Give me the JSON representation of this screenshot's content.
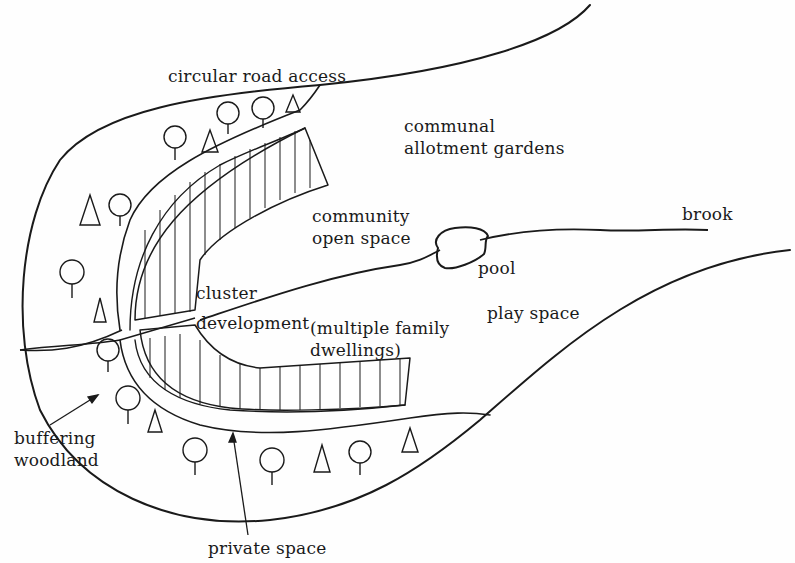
{
  "diagram": {
    "type": "site-plan-sketch",
    "labels": {
      "circular_road_access": "circular road access",
      "communal_allotment_1": "communal",
      "communal_allotment_2": "allotment gardens",
      "community_open_1": "community",
      "community_open_2": "open space",
      "brook": "brook",
      "pool": "pool",
      "cluster": "cluster",
      "development": "development",
      "multiple_family_1": "(multiple family",
      "multiple_family_2": "dwellings)",
      "play_space": "play space",
      "buffering_1": "buffering",
      "buffering_2": "woodland",
      "private_space": "private space"
    },
    "colors": {
      "ink": "#1a1a1a",
      "paper": "#fefefe"
    }
  }
}
